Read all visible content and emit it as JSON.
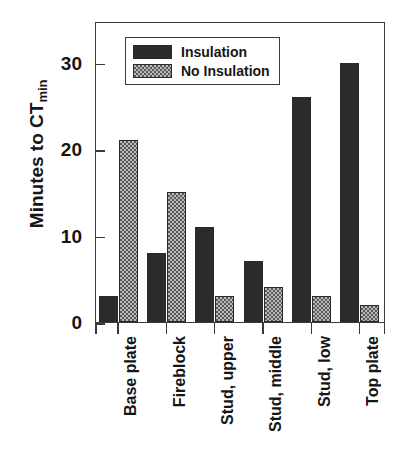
{
  "chart_data": {
    "type": "bar",
    "title": "",
    "xlabel": "",
    "ylabel": "Minutes to CT",
    "ylabel_sub": "min",
    "categories": [
      "Base plate",
      "Fireblock",
      "Stud, upper",
      "Stud, middle",
      "Stud, low",
      "Top plate"
    ],
    "series": [
      {
        "name": "Insulation",
        "values": [
          3,
          8,
          11,
          7,
          26,
          30
        ],
        "color": "#2b2b2b",
        "fill": "solid"
      },
      {
        "name": "No Insulation",
        "values": [
          21,
          15,
          3,
          4,
          3,
          2
        ],
        "color": "#b9b9b9",
        "fill": "stipple"
      }
    ],
    "ylim": [
      0,
      34.8
    ],
    "yticks": [
      0,
      10,
      20,
      30
    ],
    "ytick_labels": [
      "0",
      "10",
      "20",
      "30"
    ],
    "grid": false,
    "legend_position": "top-left"
  },
  "legend": {
    "items": [
      {
        "label": "Insulation",
        "fill": "solid"
      },
      {
        "label": "No Insulation",
        "fill": "stipple"
      }
    ]
  },
  "axis": {
    "y_title_main": "Minutes to CT",
    "y_title_sub": "min"
  }
}
